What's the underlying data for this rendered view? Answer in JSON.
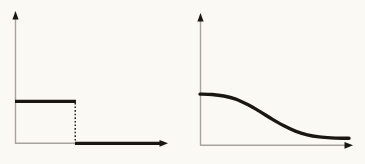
{
  "figure": {
    "background_color": "#faf9f3",
    "line_color": "#1a1713",
    "axis_color": "#a6a49c",
    "panel_count": 2
  },
  "panels": [
    {
      "id": "left",
      "name": "step-function-plot",
      "description": "step function",
      "axes": {
        "x_axis_label": "",
        "y_axis_label": "",
        "origin_x": 15,
        "origin_y": 143,
        "y_top": 13,
        "x_right": 167,
        "has_arrow_heads": true,
        "has_tick_labels": false,
        "has_grid": false
      }
    },
    {
      "id": "right",
      "name": "sigmoid-decay-plot",
      "description": "smooth sigmoid decay",
      "axes": {
        "x_axis_label": "",
        "y_axis_label": "",
        "origin_x": 17,
        "origin_y": 145,
        "y_top": 14,
        "x_right": 169,
        "has_arrow_heads": true,
        "has_tick_labels": false,
        "has_grid": false
      }
    }
  ],
  "chart_data": [
    {
      "type": "line",
      "id": "step-function",
      "title": "",
      "subtitle": "",
      "xlabel": "",
      "ylabel": "",
      "xlim": [
        0,
        10
      ],
      "ylim": [
        0,
        10
      ],
      "grid": false,
      "legend": null,
      "annotations": [
        {
          "name": "discontinuity-drop",
          "kind": "dashed-vertical",
          "x": 4.05,
          "y_from": 3.4,
          "y_to": 0.0
        }
      ],
      "series": [
        {
          "name": "step",
          "style": "piecewise-constant",
          "x": [
            0.0,
            4.05,
            4.05,
            9.95
          ],
          "values": [
            3.4,
            3.4,
            0.0,
            0.0
          ]
        }
      ]
    },
    {
      "type": "line",
      "id": "sigmoid-decay",
      "title": "",
      "subtitle": "",
      "xlabel": "",
      "ylabel": "",
      "xlim": [
        0,
        10
      ],
      "ylim": [
        0,
        10
      ],
      "grid": false,
      "legend": null,
      "annotations": [],
      "series": [
        {
          "name": "smooth-decay",
          "style": "sigmoid",
          "x": [
            0.0,
            0.8,
            1.6,
            2.4,
            3.2,
            4.0,
            4.8,
            5.6,
            6.4,
            7.2,
            8.0,
            8.8,
            9.6,
            10.0
          ],
          "values": [
            4.15,
            4.12,
            4.0,
            3.75,
            3.3,
            2.75,
            2.15,
            1.6,
            1.15,
            0.85,
            0.68,
            0.6,
            0.57,
            0.57
          ]
        }
      ]
    }
  ],
  "labels": {
    "left_panel_caption": "",
    "right_panel_caption": ""
  }
}
